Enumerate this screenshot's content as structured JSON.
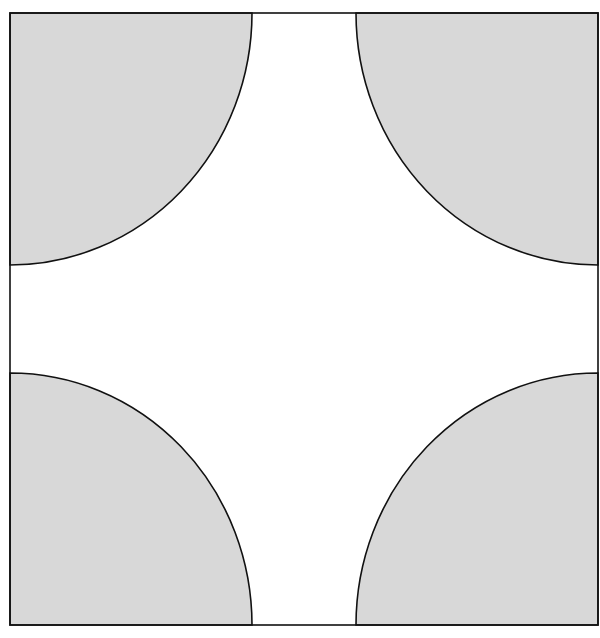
{
  "diagram": {
    "type": "geometry",
    "square": {
      "x": 10,
      "y": 13,
      "width": 588,
      "height": 612
    },
    "quarter_circle": {
      "rx": 242,
      "ry": 252
    },
    "colors": {
      "fill": "#d8d8d8",
      "stroke": "#111111",
      "background": "#ffffff"
    },
    "corners": [
      "top-left",
      "top-right",
      "bottom-left",
      "bottom-right"
    ]
  }
}
